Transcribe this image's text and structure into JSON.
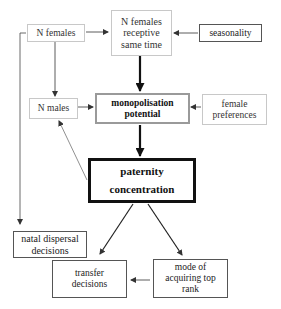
{
  "diagram": {
    "nodes": {
      "n_females": "N females",
      "receptive": "N females receptive same time",
      "seasonality": "seasonality",
      "n_males": "N males",
      "monopolisation": "monopolisation potential",
      "female_preferences": "female preferences",
      "paternity": "paternity concentration",
      "natal_dispersal": "natal dispersal decisions",
      "transfer": "transfer decisions",
      "mode_top_rank": "mode of acquiring top rank"
    },
    "edges": [
      {
        "from": "n_females",
        "to": "receptive"
      },
      {
        "from": "seasonality",
        "to": "receptive"
      },
      {
        "from": "n_females",
        "to": "n_males"
      },
      {
        "from": "n_females",
        "to": "natal_dispersal"
      },
      {
        "from": "receptive",
        "to": "monopolisation",
        "weight": "thick"
      },
      {
        "from": "n_males",
        "to": "monopolisation"
      },
      {
        "from": "female_preferences",
        "to": "monopolisation"
      },
      {
        "from": "monopolisation",
        "to": "paternity",
        "weight": "thick"
      },
      {
        "from": "paternity",
        "to": "n_males"
      },
      {
        "from": "paternity",
        "to": "transfer"
      },
      {
        "from": "paternity",
        "to": "mode_top_rank"
      },
      {
        "from": "mode_top_rank",
        "to": "transfer"
      }
    ]
  }
}
